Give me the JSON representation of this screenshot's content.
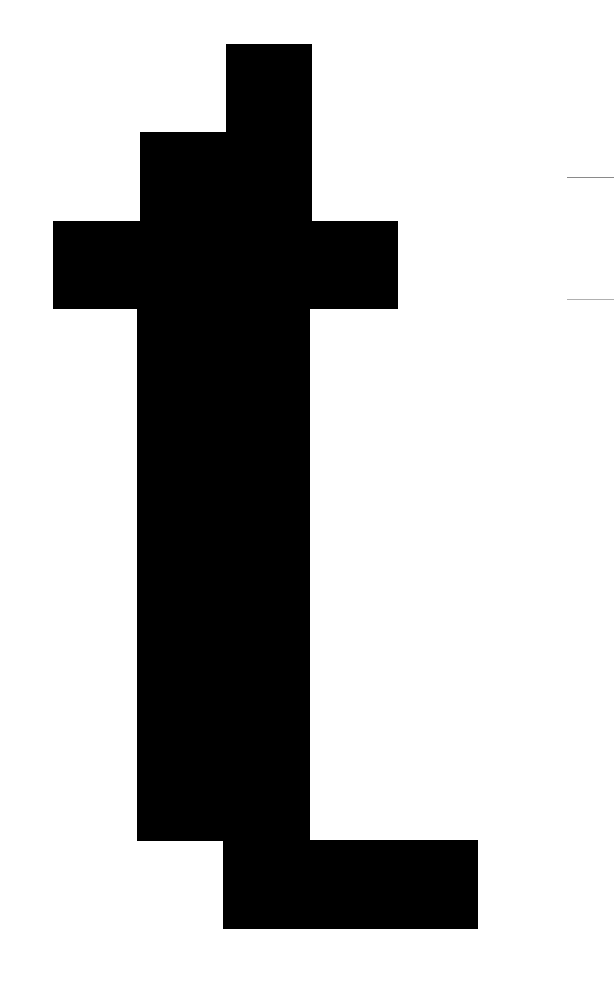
{
  "glyph": {
    "character": "t",
    "color": "#000000",
    "background": "#ffffff",
    "blocks": [
      {
        "name": "top-block",
        "x": 226,
        "y": 44,
        "w": 86,
        "h": 88
      },
      {
        "name": "upper-step-block",
        "x": 140,
        "y": 132,
        "w": 172,
        "h": 90
      },
      {
        "name": "crossbar-block",
        "x": 53,
        "y": 221,
        "w": 345,
        "h": 88
      },
      {
        "name": "stem-block",
        "x": 137,
        "y": 308,
        "w": 173,
        "h": 533
      },
      {
        "name": "foot-block",
        "x": 223,
        "y": 840,
        "w": 255,
        "h": 89
      }
    ]
  },
  "rules": [
    {
      "name": "upper-guide-line",
      "x": 567,
      "y": 177,
      "w": 47,
      "color": "#8a8a8a"
    },
    {
      "name": "lower-guide-line",
      "x": 567,
      "y": 299,
      "w": 47,
      "color": "#b0b0b0"
    }
  ]
}
